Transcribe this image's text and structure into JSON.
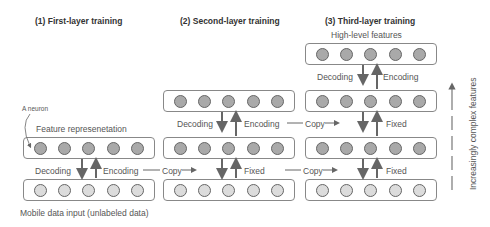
{
  "titles": {
    "first": "(1) First-layer training",
    "second": "(2) Second-layer training",
    "third": "(3) Third-layer training"
  },
  "labels": {
    "a_neuron": "A neuron",
    "feature_representation": "Feature represenetation",
    "mobile_input": "Mobile data input (unlabeled data)",
    "high_level": "High-level features",
    "decoding": "Decoding",
    "encoding": "Encoding",
    "copy": "Copy",
    "fixed": "Fixed",
    "increasing": "Increasingly complex features"
  },
  "neurons_per_layer": 5,
  "colors": {
    "hidden_neuron": "#a9a9a9",
    "input_neuron": "#dcdcdc",
    "arrow": "#666666"
  }
}
